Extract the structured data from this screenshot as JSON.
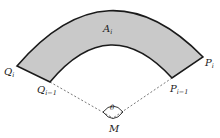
{
  "diagram": {
    "type": "annular-sector",
    "colors": {
      "fill": "#c9c9c9",
      "stroke": "#1a1a1a",
      "dashed": "#555555",
      "background": "#ffffff"
    },
    "labels": {
      "area": {
        "base": "A",
        "sub": "i"
      },
      "outer_left": {
        "base": "Q",
        "sub": "i"
      },
      "inner_left": {
        "base": "Q",
        "sub": "i−1"
      },
      "outer_right": {
        "base": "P",
        "sub": "i"
      },
      "inner_right": {
        "base": "P",
        "sub": "i−1"
      },
      "center": {
        "base": "M"
      },
      "angle": {
        "base": "θ"
      }
    }
  }
}
